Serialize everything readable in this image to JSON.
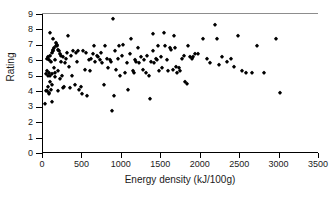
{
  "chart_data": {
    "type": "scatter",
    "title": "",
    "xlabel": "Energy density (kJ/100g)",
    "ylabel": "Rating",
    "xlim": [
      0,
      3500
    ],
    "ylim": [
      0,
      9
    ],
    "xticks": [
      0,
      500,
      1000,
      1500,
      2000,
      2500,
      3000,
      3500
    ],
    "yticks": [
      0,
      1,
      2,
      3,
      4,
      5,
      6,
      7,
      8,
      9
    ],
    "grid": false,
    "legend": null,
    "marker": {
      "shape": "diamond",
      "color": "#000000",
      "size": 3.4
    },
    "points": [
      [
        30,
        3.2
      ],
      [
        35,
        4.0
      ],
      [
        40,
        5.1
      ],
      [
        45,
        5.3
      ],
      [
        50,
        4.0
      ],
      [
        55,
        6.1
      ],
      [
        60,
        5.0
      ],
      [
        62,
        6.2
      ],
      [
        68,
        4.3
      ],
      [
        70,
        3.9
      ],
      [
        75,
        5.2
      ],
      [
        78,
        6.0
      ],
      [
        82,
        3.8
      ],
      [
        85,
        5.0
      ],
      [
        88,
        4.6
      ],
      [
        92,
        6.3
      ],
      [
        95,
        7.8
      ],
      [
        100,
        5.9
      ],
      [
        103,
        4.1
      ],
      [
        108,
        3.3
      ],
      [
        112,
        6.5
      ],
      [
        115,
        5.1
      ],
      [
        118,
        4.4
      ],
      [
        122,
        6.6
      ],
      [
        128,
        7.4
      ],
      [
        132,
        6.7
      ],
      [
        138,
        5.5
      ],
      [
        142,
        6.8
      ],
      [
        148,
        4.9
      ],
      [
        152,
        6.0
      ],
      [
        158,
        5.2
      ],
      [
        163,
        6.9
      ],
      [
        168,
        7.1
      ],
      [
        172,
        7.0
      ],
      [
        178,
        6.9
      ],
      [
        185,
        6.7
      ],
      [
        190,
        4.0
      ],
      [
        196,
        5.3
      ],
      [
        205,
        6.6
      ],
      [
        212,
        4.8
      ],
      [
        218,
        6.4
      ],
      [
        225,
        6.3
      ],
      [
        232,
        5.9
      ],
      [
        240,
        5.0
      ],
      [
        248,
        4.2
      ],
      [
        258,
        6.2
      ],
      [
        268,
        4.3
      ],
      [
        278,
        5.8
      ],
      [
        290,
        6.1
      ],
      [
        300,
        6.5
      ],
      [
        318,
        7.6
      ],
      [
        330,
        5.6
      ],
      [
        345,
        4.2
      ],
      [
        358,
        6.3
      ],
      [
        370,
        5.0
      ],
      [
        385,
        6.6
      ],
      [
        400,
        4.4
      ],
      [
        415,
        6.5
      ],
      [
        430,
        5.9
      ],
      [
        448,
        6.6
      ],
      [
        462,
        4.1
      ],
      [
        478,
        4.3
      ],
      [
        495,
        3.8
      ],
      [
        510,
        6.6
      ],
      [
        528,
        5.4
      ],
      [
        545,
        6.5
      ],
      [
        560,
        3.7
      ],
      [
        578,
        6.0
      ],
      [
        592,
        5.3
      ],
      [
        610,
        6.1
      ],
      [
        628,
        6.4
      ],
      [
        648,
        6.9
      ],
      [
        665,
        5.9
      ],
      [
        680,
        6.3
      ],
      [
        700,
        6.2
      ],
      [
        718,
        6.0
      ],
      [
        735,
        6.5
      ],
      [
        752,
        5.8
      ],
      [
        770,
        4.4
      ],
      [
        790,
        6.9
      ],
      [
        810,
        6.1
      ],
      [
        830,
        5.5
      ],
      [
        850,
        6.0
      ],
      [
        868,
        5.9
      ],
      [
        880,
        2.7
      ],
      [
        890,
        8.7
      ],
      [
        900,
        3.7
      ],
      [
        915,
        6.6
      ],
      [
        932,
        5.4
      ],
      [
        948,
        6.1
      ],
      [
        965,
        6.9
      ],
      [
        982,
        5.0
      ],
      [
        1000,
        6.3
      ],
      [
        1020,
        7.0
      ],
      [
        1040,
        5.2
      ],
      [
        1060,
        5.8
      ],
      [
        1080,
        4.1
      ],
      [
        1100,
        6.4
      ],
      [
        1118,
        7.4
      ],
      [
        1135,
        5.3
      ],
      [
        1150,
        5.2
      ],
      [
        1168,
        6.0
      ],
      [
        1185,
        5.9
      ],
      [
        1200,
        6.8
      ],
      [
        1220,
        5.8
      ],
      [
        1240,
        6.2
      ],
      [
        1262,
        5.4
      ],
      [
        1285,
        6.0
      ],
      [
        1305,
        5.2
      ],
      [
        1325,
        6.3
      ],
      [
        1345,
        5.0
      ],
      [
        1358,
        3.5
      ],
      [
        1375,
        5.9
      ],
      [
        1392,
        6.6
      ],
      [
        1400,
        7.7
      ],
      [
        1412,
        5.8
      ],
      [
        1428,
        6.1
      ],
      [
        1442,
        6.0
      ],
      [
        1458,
        6.9
      ],
      [
        1475,
        5.3
      ],
      [
        1492,
        6.2
      ],
      [
        1512,
        5.5
      ],
      [
        1530,
        7.8
      ],
      [
        1548,
        6.9
      ],
      [
        1568,
        6.0
      ],
      [
        1585,
        5.3
      ],
      [
        1605,
        6.8
      ],
      [
        1625,
        6.7
      ],
      [
        1645,
        5.4
      ],
      [
        1662,
        7.6
      ],
      [
        1678,
        6.8
      ],
      [
        1692,
        5.6
      ],
      [
        1705,
        5.2
      ],
      [
        1722,
        5.5
      ],
      [
        1740,
        5.3
      ],
      [
        1760,
        6.1
      ],
      [
        1785,
        6.3
      ],
      [
        1805,
        4.6
      ],
      [
        1820,
        4.5
      ],
      [
        1838,
        6.9
      ],
      [
        1858,
        6.2
      ],
      [
        1885,
        6.1
      ],
      [
        1908,
        6.2
      ],
      [
        1930,
        6.4
      ],
      [
        1960,
        6.4
      ],
      [
        2030,
        7.4
      ],
      [
        2080,
        6.1
      ],
      [
        2120,
        5.8
      ],
      [
        2180,
        8.3
      ],
      [
        2205,
        7.4
      ],
      [
        2230,
        5.7
      ],
      [
        2265,
        6.2
      ],
      [
        2330,
        5.9
      ],
      [
        2390,
        6.1
      ],
      [
        2420,
        5.6
      ],
      [
        2470,
        7.6
      ],
      [
        2520,
        5.3
      ],
      [
        2580,
        5.2
      ],
      [
        2650,
        5.2
      ],
      [
        2720,
        6.9
      ],
      [
        2800,
        5.2
      ],
      [
        2960,
        7.4
      ],
      [
        3010,
        3.9
      ]
    ]
  }
}
